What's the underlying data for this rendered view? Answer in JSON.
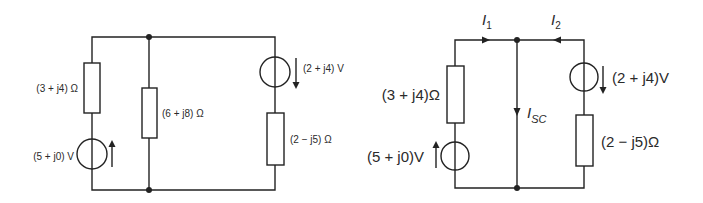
{
  "left_circuit": {
    "resistor_left": {
      "label": "(3 + j4) Ω"
    },
    "source_left": {
      "label": "(5 + j0) V",
      "arrow": "up"
    },
    "resistor_middle": {
      "label": "(6 + j8) Ω"
    },
    "source_right": {
      "label": "(2 + j4) V",
      "arrow": "down"
    },
    "resistor_right": {
      "label": "(2 − j5) Ω"
    }
  },
  "right_circuit": {
    "current_i1": {
      "label": "I",
      "sub": "1",
      "direction": "right"
    },
    "current_i2": {
      "label": "I",
      "sub": "2",
      "direction": "left"
    },
    "current_isc": {
      "label": "I",
      "sub": "SC",
      "direction": "down"
    },
    "resistor_left": {
      "label": "(3 + j4)Ω"
    },
    "source_left": {
      "label": "(5 + j0)V",
      "arrow": "up"
    },
    "source_right": {
      "label": "(2 + j4)V",
      "arrow": "down"
    },
    "resistor_right": {
      "label": "(2 − j5)Ω"
    }
  },
  "colors": {
    "line": "#222222",
    "text": "#2a2a2a",
    "background": "#ffffff"
  }
}
